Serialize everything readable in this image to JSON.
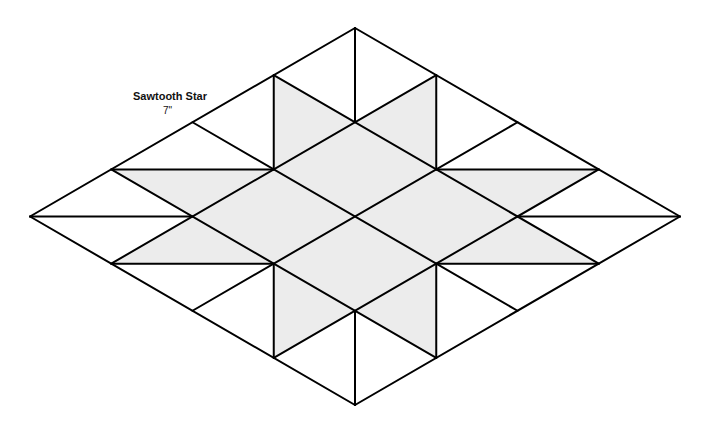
{
  "block": {
    "title": "Sawtooth Star",
    "size": "7\""
  },
  "colors": {
    "line": "#000000",
    "fill": "#ececec",
    "background": "#ffffff"
  },
  "grid": {
    "top": [
      355,
      28
    ],
    "u_step": [
      81.25,
      47.125
    ],
    "v_step": [
      -81.25,
      47.125
    ],
    "divisions": 4
  },
  "shaded_triangles": [
    [
      [
        0,
        1
      ],
      [
        1,
        1
      ],
      [
        1,
        2
      ]
    ],
    [
      [
        1,
        0
      ],
      [
        1,
        1
      ],
      [
        2,
        1
      ]
    ],
    [
      [
        0,
        3
      ],
      [
        1,
        2
      ],
      [
        1,
        3
      ]
    ],
    [
      [
        1,
        3
      ],
      [
        2,
        3
      ],
      [
        1,
        4
      ]
    ],
    [
      [
        2,
        1
      ],
      [
        3,
        0
      ],
      [
        3,
        1
      ]
    ],
    [
      [
        3,
        1
      ],
      [
        4,
        1
      ],
      [
        3,
        2
      ]
    ],
    [
      [
        2,
        3
      ],
      [
        3,
        3
      ],
      [
        3,
        4
      ]
    ],
    [
      [
        3,
        2
      ],
      [
        3,
        3
      ],
      [
        4,
        3
      ]
    ]
  ],
  "shaded_cells": [
    [
      1,
      1
    ],
    [
      1,
      2
    ],
    [
      2,
      1
    ],
    [
      2,
      2
    ]
  ],
  "diagonals": [
    [
      [
        0,
        1
      ],
      [
        1,
        2
      ]
    ],
    [
      [
        1,
        0
      ],
      [
        2,
        1
      ]
    ],
    [
      [
        0,
        3
      ],
      [
        1,
        2
      ]
    ],
    [
      [
        1,
        4
      ],
      [
        2,
        3
      ]
    ],
    [
      [
        2,
        1
      ],
      [
        3,
        0
      ]
    ],
    [
      [
        3,
        2
      ],
      [
        4,
        1
      ]
    ],
    [
      [
        2,
        3
      ],
      [
        3,
        4
      ]
    ],
    [
      [
        3,
        2
      ],
      [
        4,
        3
      ]
    ],
    [
      [
        0,
        0
      ],
      [
        1,
        1
      ]
    ],
    [
      [
        0,
        4
      ],
      [
        1,
        3
      ]
    ],
    [
      [
        4,
        0
      ],
      [
        3,
        1
      ]
    ],
    [
      [
        4,
        4
      ],
      [
        3,
        3
      ]
    ]
  ]
}
